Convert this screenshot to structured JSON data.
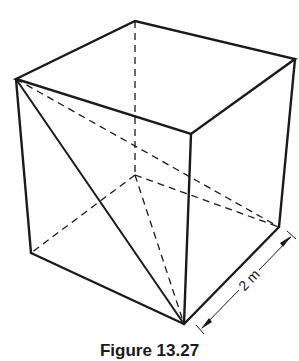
{
  "figure": {
    "caption": "Figure 13.27",
    "dimension_label": "2 m"
  },
  "colors": {
    "line": "#1a1a1a",
    "background": "#ffffff"
  }
}
